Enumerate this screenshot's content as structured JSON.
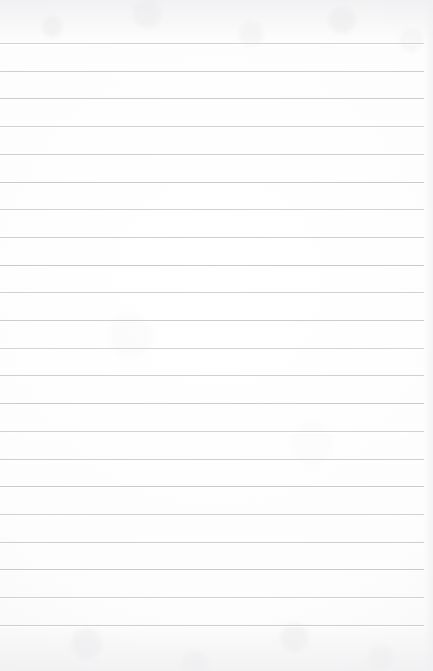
{
  "document": {
    "kind": "lined-notebook-page",
    "title": "Lined Notebook Page",
    "description": "Blank ruled notebook paper, scanned",
    "written_content": "",
    "page_number": "",
    "header_text": "",
    "footer_text": ""
  },
  "paper": {
    "background_color": "#fdfdfd",
    "edge_shadow_color": "#f0f0f2",
    "texture": "faint scan mottling in top and bottom margins"
  },
  "ruling": {
    "line_color": "#c9cbcc",
    "line_thickness_px": 1,
    "line_count": 22,
    "first_line_y": 43,
    "line_spacing_px": 27.7,
    "line_left_x": 0,
    "line_right_x": 424,
    "has_vertical_margin_rule": false,
    "top_margin_px": 43,
    "bottom_margin_px": 47
  },
  "canvas": {
    "width": 433,
    "height": 671
  }
}
